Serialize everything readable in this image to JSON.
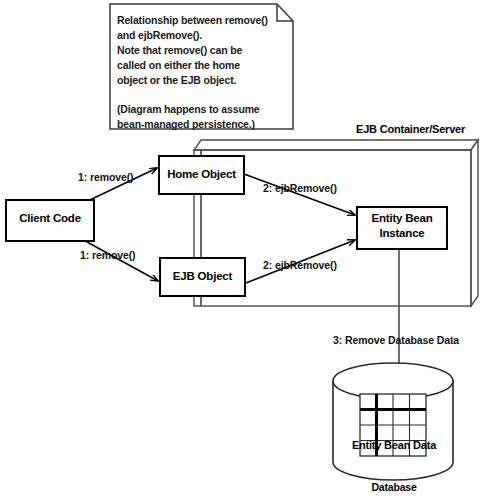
{
  "note": {
    "name": "diagram-note",
    "lines": [
      "Relationship between remove()",
      "and ejbRemove().",
      "Note that remove() can be",
      "called on either the home",
      "object or the EJB object.",
      "",
      "(Diagram happens to assume",
      "bean-managed persistence.)"
    ],
    "text": "Relationship between remove()\nand ejbRemove().\nNote that remove() can be\ncalled on either the home\nobject or the EJB object.\n\n(Diagram happens to assume\nbean-managed persistence.)"
  },
  "container": {
    "title": "EJB Container/Server"
  },
  "nodes": {
    "client": {
      "label": "Client Code"
    },
    "home": {
      "label": "Home Object"
    },
    "ejb_object": {
      "label": "EJB Object"
    },
    "entity_bean": {
      "label": "Entity Bean\nInstance",
      "line1": "Entity Bean",
      "line2": "Instance"
    }
  },
  "messages": {
    "m1a": "1: remove()",
    "m1b": "1: remove()",
    "m2a": "2: ejbRemove()",
    "m2b": "2: ejbRemove()",
    "m3": "3: Remove Database Data"
  },
  "database": {
    "inner_label": "Entity Bean Data",
    "caption": "Database"
  },
  "colors": {
    "stroke": "#000000",
    "fill": "#ffffff",
    "text": "#000000",
    "container_stroke": "#4d4d4d",
    "background": "#ffffff"
  }
}
